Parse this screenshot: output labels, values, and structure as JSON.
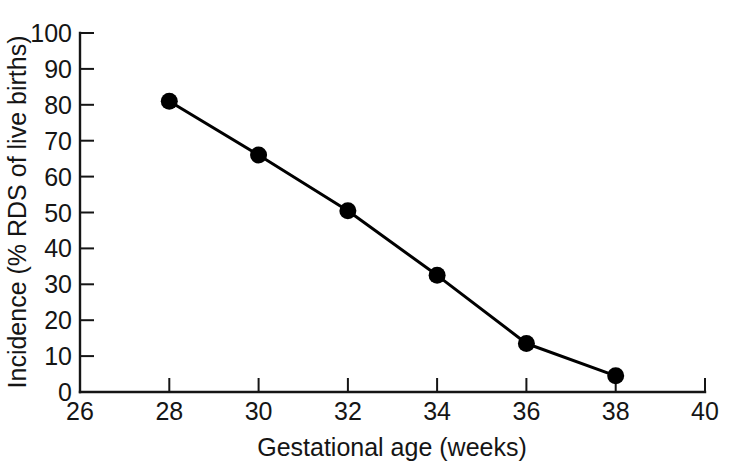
{
  "chart_data": {
    "type": "line",
    "title": "",
    "xlabel": "Gestational age (weeks)",
    "ylabel": "Incidence (% RDS of live births)",
    "xlim": [
      26,
      40
    ],
    "ylim": [
      0,
      100
    ],
    "grid": false,
    "legend": "none",
    "x": [
      28,
      30,
      32,
      34,
      36,
      38
    ],
    "values": [
      81,
      66,
      50.5,
      32.5,
      13.5,
      4.5
    ],
    "series": [
      {
        "name": "Incidence of RDS",
        "x": [
          28,
          30,
          32,
          34,
          36,
          38
        ],
        "values": [
          81,
          66,
          50.5,
          32.5,
          13.5,
          4.5
        ],
        "marker": "filled-circle",
        "color": "#000000"
      }
    ],
    "xticks": [
      26,
      28,
      30,
      32,
      34,
      36,
      38,
      40
    ],
    "xtick_labels": [
      "26",
      "28",
      "30",
      "32",
      "34",
      "36",
      "38",
      "40"
    ],
    "yticks": [
      0,
      10,
      20,
      30,
      40,
      50,
      60,
      70,
      80,
      90,
      100
    ],
    "ytick_labels": [
      "0",
      "10",
      "20",
      "30",
      "40",
      "50",
      "60",
      "70",
      "80",
      "90",
      "100"
    ],
    "annotations": []
  },
  "colors": {
    "background": "#ffffff",
    "axis": "#151515",
    "series": "#000000",
    "text": "#151515"
  }
}
